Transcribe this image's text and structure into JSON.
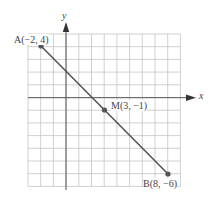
{
  "diagram": {
    "type": "coordinate-plane-segment",
    "axes": {
      "x_label": "x",
      "y_label": "y",
      "x_range": [
        -3,
        9
      ],
      "y_range": [
        -7,
        5
      ]
    },
    "points": [
      {
        "name": "A",
        "label": "A(−2, 4)",
        "x": -2,
        "y": 4
      },
      {
        "name": "M",
        "label": "M(3, −1)",
        "x": 3,
        "y": -1
      },
      {
        "name": "B",
        "label": "B(8, −6)",
        "x": 8,
        "y": -6
      }
    ],
    "colors": {
      "grid": "#bbbbbb",
      "axis": "#555555",
      "segment": "#555555",
      "point": "#555555"
    }
  }
}
